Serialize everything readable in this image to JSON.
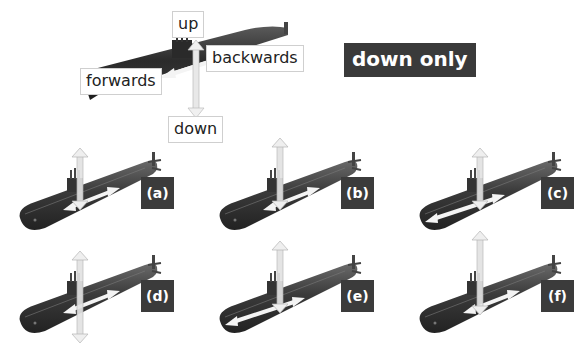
{
  "colors": {
    "hull_dark": "#2f2f2f",
    "hull_mid": "#4a4a4a",
    "hull_light": "#6a6a6a",
    "label_dark_bg": "#3b3b3b",
    "label_light_border": "#cfcfcf",
    "arrow_fill": "#f2f2f2",
    "arrow_stroke": "#bdbdbd"
  },
  "key_diagram": {
    "labels": {
      "up": "up",
      "down": "down",
      "forwards": "forwards",
      "backwards": "backwards"
    }
  },
  "question": {
    "label": "down only"
  },
  "options": [
    {
      "label": "(a)",
      "vertical_arrow": "short",
      "horizontal_arrow": "both"
    },
    {
      "label": "(b)",
      "vertical_arrow": "tall",
      "horizontal_arrow": "both"
    },
    {
      "label": "(c)",
      "vertical_arrow": "short",
      "horizontal_arrow": "long-both"
    },
    {
      "label": "(d)",
      "vertical_arrow": "down-long",
      "horizontal_arrow": "both"
    },
    {
      "label": "(e)",
      "vertical_arrow": "tall",
      "horizontal_arrow": "long-both"
    },
    {
      "label": "(f)",
      "vertical_arrow": "up-long",
      "horizontal_arrow": "both"
    }
  ]
}
